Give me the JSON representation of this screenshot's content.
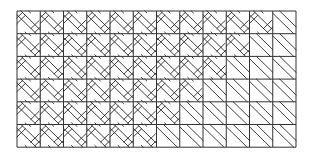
{
  "figure": {
    "grid": {
      "origin_x": 17,
      "origin_y": 11,
      "columns": 12,
      "rows": 6,
      "cell_width": 23.25,
      "cell_height": 22.7
    },
    "colors": {
      "line": "#2a2a2a",
      "background": "#ffffff"
    },
    "cell_types": {
      "W": "woven-basketweave",
      "D": "diagonal-hatch"
    },
    "rows": [
      "WWWWWWWWWWWD",
      "WWWWWWWWWWDD",
      "WWWWWWWWWDDD",
      "WWWWWWWWDDDD",
      "WWWWWWWDDDDD",
      "WWWWWWDDDDDD"
    ]
  }
}
